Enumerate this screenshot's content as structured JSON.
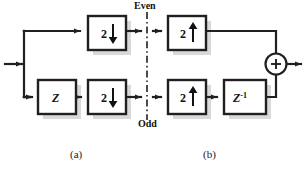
{
  "figure": {
    "type": "block-diagram",
    "background_color": "#ffffff",
    "line_color": "#231f20",
    "shadow_color": "#d9d9d9",
    "box_fill": "#ffffff"
  },
  "labels": {
    "even": "Even",
    "odd": "Odd",
    "caption_a": "(a)",
    "caption_b": "(b)"
  },
  "panel_a": {
    "name": "analysis-section",
    "blocks": [
      {
        "id": "down-even",
        "label": "2",
        "arrow": "down",
        "meaning": "downsample-by-2",
        "x": 88,
        "y": 16,
        "w": 38,
        "h": 34
      },
      {
        "id": "delay-z",
        "label": "Z",
        "arrow": "none",
        "meaning": "advance-delay",
        "x": 38,
        "y": 80,
        "w": 38,
        "h": 34
      },
      {
        "id": "down-odd",
        "label": "2",
        "arrow": "down",
        "meaning": "downsample-by-2",
        "x": 88,
        "y": 80,
        "w": 38,
        "h": 34
      }
    ],
    "input_label": "",
    "branch": "split-to-even-and-odd-paths"
  },
  "panel_b": {
    "name": "synthesis-section",
    "blocks": [
      {
        "id": "up-even",
        "label": "2",
        "arrow": "up",
        "meaning": "upsample-by-2",
        "x": 168,
        "y": 16,
        "w": 38,
        "h": 34
      },
      {
        "id": "up-odd",
        "label": "2",
        "arrow": "up",
        "meaning": "upsample-by-2",
        "x": 168,
        "y": 80,
        "w": 38,
        "h": 34
      },
      {
        "id": "delay-zinv",
        "label": "Z",
        "sup": "-1",
        "arrow": "none",
        "meaning": "unit-delay",
        "x": 224,
        "y": 80,
        "w": 42,
        "h": 34
      }
    ],
    "adder": {
      "id": "summing-junction",
      "symbol": "+",
      "cx": 276,
      "cy": 64,
      "r": 10
    }
  },
  "divider": {
    "style": "dash-dot",
    "x": 147,
    "y1": 12,
    "y2": 120
  }
}
